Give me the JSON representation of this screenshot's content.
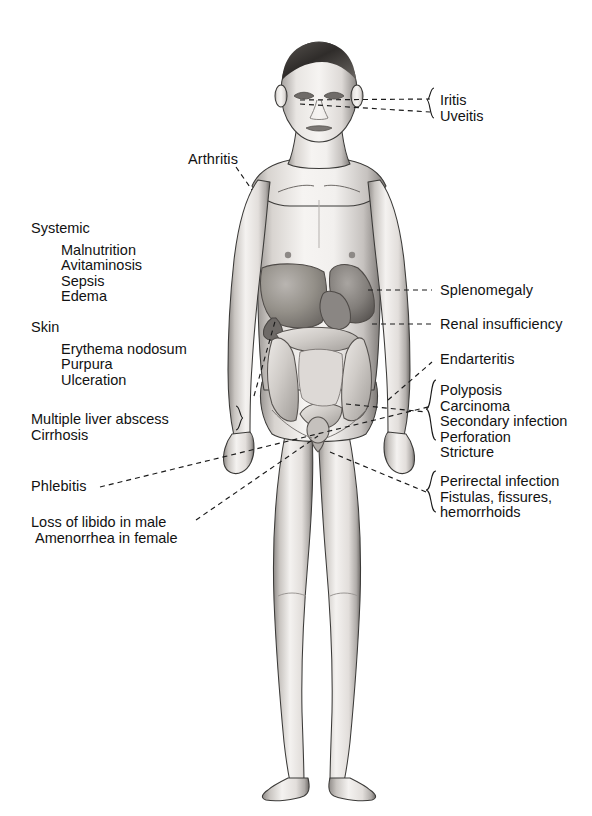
{
  "page": {
    "background": "#ffffff",
    "ink": "#121212",
    "width": 592,
    "height": 816
  },
  "figure": {
    "name": "anterior full-body male anatomical figure with abdominal viscera exposed",
    "skin_light": "#f2f0ee",
    "skin_mid": "#cdc9c5",
    "skin_shadow": "#8d8986",
    "outline": "#3b3a38",
    "organ_dark": "#7e7a77",
    "organ_mid": "#a6a29e",
    "organ_light": "#d6d2ce"
  },
  "labels": {
    "eye": {
      "items": [
        "Iritis",
        "Uveitis"
      ],
      "x": 440,
      "y": 93
    },
    "arthritis": {
      "text": "Arthritis",
      "x": 188,
      "y": 152
    },
    "systemic": {
      "header": "Systemic",
      "items": [
        "Malnutrition",
        "Avitaminosis",
        "Sepsis",
        "Edema"
      ],
      "x": 31,
      "y": 221
    },
    "skin": {
      "header": "Skin",
      "items": [
        "Erythema nodosum",
        "Purpura",
        "Ulceration"
      ],
      "x": 31,
      "y": 320
    },
    "liver": {
      "items": [
        "Multiple liver abscess",
        "Cirrhosis"
      ],
      "x": 31,
      "y": 412
    },
    "phlebitis": {
      "text": "Phlebitis",
      "x": 31,
      "y": 479
    },
    "libido": {
      "items": [
        "Loss of libido in male",
        "Amenorrhea in female"
      ],
      "x": 31,
      "y": 515
    },
    "splenomegaly": {
      "text": "Splenomegaly",
      "x": 440,
      "y": 283
    },
    "renal": {
      "text": "Renal insufficiency",
      "x": 440,
      "y": 317
    },
    "endarteritis": {
      "text": "Endarteritis",
      "x": 440,
      "y": 352
    },
    "bowel": {
      "items": [
        "Polyposis",
        "Carcinoma",
        "Secondary infection",
        "Perforation",
        "Stricture"
      ],
      "x": 440,
      "y": 383
    },
    "perirectal": {
      "items": [
        "Perirectal infection",
        "Fistulas, fissures,",
        "hemorrhoids"
      ],
      "x": 440,
      "y": 474
    }
  }
}
